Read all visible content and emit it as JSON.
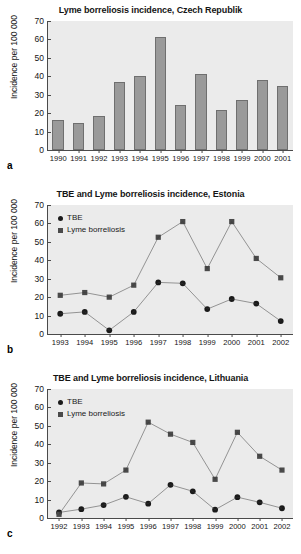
{
  "figure": {
    "panels": [
      {
        "letter": "a",
        "chart_data": {
          "type": "bar",
          "title": "Lyme borreliosis incidence, Czech Republik",
          "xlabel": "",
          "ylabel": "Incidence per 100 000",
          "ylim": [
            0,
            70
          ],
          "yticks": [
            0,
            10,
            20,
            30,
            40,
            50,
            60,
            70
          ],
          "grid": false,
          "legend": null,
          "categories": [
            "1990",
            "1991",
            "1992",
            "1993",
            "1994",
            "1995",
            "1996",
            "1997",
            "1998",
            "1999",
            "2000",
            "2001"
          ],
          "values": [
            16.5,
            14.5,
            18.5,
            37,
            40,
            61.5,
            24.5,
            41,
            21.5,
            27,
            38,
            35
          ]
        }
      },
      {
        "letter": "b",
        "chart_data": {
          "type": "line",
          "title": "TBE and Lyme borreliosis incidence, Estonia",
          "xlabel": "",
          "ylabel": "Incidence per 100 000",
          "ylim": [
            0,
            70
          ],
          "yticks": [
            0,
            10,
            20,
            30,
            40,
            50,
            60,
            70
          ],
          "grid": false,
          "legend_position": "top-left",
          "categories": [
            "1993",
            "1994",
            "1995",
            "1996",
            "1997",
            "1998",
            "1999",
            "2000",
            "2001",
            "2002"
          ],
          "series": [
            {
              "name": "TBE",
              "marker": "circle",
              "values": [
                11,
                12,
                2,
                12,
                28,
                27.5,
                13.5,
                19,
                16.5,
                7
              ]
            },
            {
              "name": "Lyme borreliosis",
              "marker": "square",
              "values": [
                21,
                22.5,
                20,
                26.5,
                52.5,
                61,
                35.5,
                61,
                41,
                30.5
              ]
            }
          ]
        }
      },
      {
        "letter": "c",
        "chart_data": {
          "type": "line",
          "title": "TBE and Lyme borreliosis incidence, Lithuania",
          "xlabel": "",
          "ylabel": "Incidence per 100 000",
          "ylim": [
            0,
            70
          ],
          "yticks": [
            0,
            10,
            20,
            30,
            40,
            50,
            60,
            70
          ],
          "grid": false,
          "legend_position": "top-left",
          "categories": [
            "1992",
            "1993",
            "1994",
            "1995",
            "1996",
            "1997",
            "1998",
            "1999",
            "2000",
            "2001",
            "2002"
          ],
          "series": [
            {
              "name": "TBE",
              "marker": "circle",
              "values": [
                3,
                4.8,
                7,
                11.5,
                7.8,
                18,
                14.5,
                4.5,
                11.3,
                8.5,
                5.3
              ]
            },
            {
              "name": "Lyme borreliosis",
              "marker": "square",
              "values": [
                2,
                19,
                18.5,
                26,
                52,
                45.5,
                41,
                21,
                46.5,
                33.5,
                26
              ]
            }
          ]
        }
      }
    ]
  },
  "colors": {
    "plot_background": "#ebebeb",
    "bar_fill": "#9a9a9a",
    "axis": "#4a4a4a",
    "tbe_marker": "#1a1a1a",
    "lyme_marker": "#4a4a4a"
  }
}
